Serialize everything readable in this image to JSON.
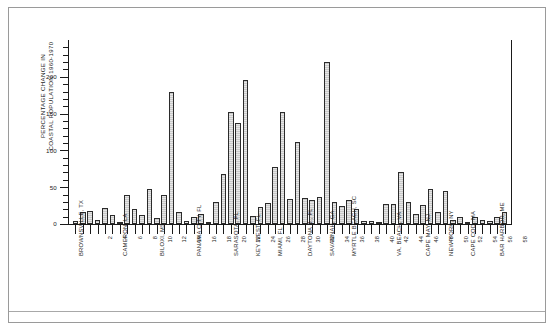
{
  "figure": {
    "title": "",
    "y_axis_title_line1": "PERCENTAGE CHANGE IN",
    "y_axis_title_line2": "COASTAL POPULATION 1960-1970"
  },
  "chart_data": {
    "type": "bar",
    "title": "",
    "xlabel": "",
    "ylabel": "PERCENTAGE CHANGE IN COASTAL POPULATION 1960-1970",
    "ylim": [
      0,
      250
    ],
    "ytick_labels": [
      "0",
      "50",
      "100",
      "150",
      "200"
    ],
    "ytick_values": [
      0,
      50,
      100,
      150,
      200
    ],
    "yminor_step": 10,
    "grid": false,
    "legend": null,
    "xtick_labels": [
      "2",
      "4",
      "6",
      "8",
      "10",
      "12",
      "14",
      "16",
      "18",
      "20",
      "22",
      "24",
      "26",
      "28",
      "30",
      "32",
      "34",
      "36",
      "38",
      "40",
      "42",
      "44",
      "46",
      "48",
      "50",
      "52",
      "54",
      "56",
      "58"
    ],
    "xtick_values": [
      2,
      4,
      6,
      8,
      10,
      12,
      14,
      16,
      18,
      20,
      22,
      24,
      26,
      28,
      30,
      32,
      34,
      36,
      38,
      40,
      42,
      44,
      46,
      48,
      50,
      52,
      54,
      56,
      58
    ],
    "city_labels": [
      {
        "x": 1,
        "label": "BROWNSVILLE, TX"
      },
      {
        "x": 7,
        "label": "CAMERON, LA"
      },
      {
        "x": 12,
        "label": "BILOXI, MS"
      },
      {
        "x": 17,
        "label": "PANAMA CITY, FL"
      },
      {
        "x": 22,
        "label": "SARASOTA, FL"
      },
      {
        "x": 25,
        "label": "KEY WEST, FL"
      },
      {
        "x": 28,
        "label": "MIAMI, FL"
      },
      {
        "x": 32,
        "label": "DAYTONA B., FL"
      },
      {
        "x": 35,
        "label": "SAVANNAH, GA"
      },
      {
        "x": 38,
        "label": "MYRTLE BEACH, SC"
      },
      {
        "x": 44,
        "label": "VA. BEACH, VA"
      },
      {
        "x": 48,
        "label": "CAPE MAY, NJ"
      },
      {
        "x": 51,
        "label": "NEW YORK, NY"
      },
      {
        "x": 54,
        "label": "CAPE COD, MA"
      },
      {
        "x": 58,
        "label": "BAR HARBOR, ME"
      }
    ],
    "x": [
      1,
      2,
      3,
      4,
      5,
      6,
      7,
      8,
      9,
      10,
      11,
      12,
      13,
      14,
      15,
      16,
      17,
      18,
      19,
      20,
      21,
      22,
      23,
      24,
      25,
      26,
      27,
      28,
      29,
      30,
      31,
      32,
      33,
      34,
      35,
      36,
      37,
      38,
      39,
      40,
      41,
      42,
      43,
      44,
      45,
      46,
      47,
      48,
      49,
      50,
      51,
      52,
      53,
      54,
      55,
      56,
      57,
      58,
      59
    ],
    "values": [
      4,
      16,
      18,
      5,
      22,
      12,
      3,
      40,
      20,
      12,
      47,
      8,
      40,
      179,
      16,
      4,
      9,
      13,
      2,
      30,
      68,
      152,
      137,
      195,
      11,
      23,
      28,
      78,
      152,
      34,
      111,
      35,
      33,
      37,
      220,
      30,
      24,
      32,
      20,
      4,
      4,
      3,
      27,
      27,
      71,
      30,
      14,
      26,
      48,
      17,
      45,
      5,
      9,
      3,
      10,
      6,
      4,
      9,
      16
    ]
  }
}
